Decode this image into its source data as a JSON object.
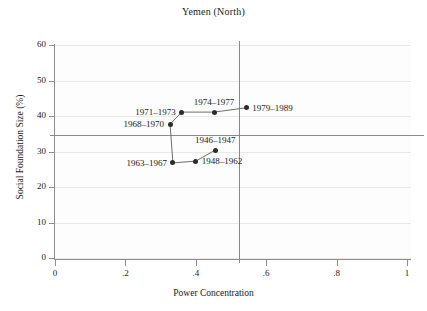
{
  "chart_data": {
    "type": "scatter",
    "title": "Yemen (North)",
    "xlabel": "Power Concentration",
    "ylabel": "Social Foundation Size (%)",
    "xlim": [
      0,
      1
    ],
    "ylim": [
      0,
      63
    ],
    "grid": true,
    "legend": "none",
    "connected": true,
    "xticks": [
      "0",
      ".2",
      ".4",
      ".6",
      ".8",
      "1"
    ],
    "xtick_values": [
      0,
      0.2,
      0.4,
      0.6,
      0.8,
      1
    ],
    "yticks": [
      "0",
      "10",
      "20",
      "30",
      "40",
      "50",
      "60"
    ],
    "ytick_values": [
      0,
      10,
      20,
      30,
      40,
      50,
      60
    ],
    "reference_lines": [
      {
        "name": "vertical-mean-power-concentration",
        "orientation": "vertical",
        "value": 0.523
      },
      {
        "name": "horizontal-mean-social-foundation",
        "orientation": "horizontal",
        "value": 34.6
      }
    ],
    "points": [
      {
        "label": "1946–1947",
        "x": 0.455,
        "y": 30.4,
        "label_pos": "above"
      },
      {
        "label": "1948–1962",
        "x": 0.4,
        "y": 27.3,
        "label_pos": "right"
      },
      {
        "label": "1963–1967",
        "x": 0.335,
        "y": 26.8,
        "label_pos": "left"
      },
      {
        "label": "1968–1970",
        "x": 0.327,
        "y": 37.7,
        "label_pos": "left"
      },
      {
        "label": "1971–1973",
        "x": 0.36,
        "y": 41.1,
        "label_pos": "left"
      },
      {
        "label": "1974–1977",
        "x": 0.452,
        "y": 41.1,
        "label_pos": "above"
      },
      {
        "label": "1979–1989",
        "x": 0.543,
        "y": 42.3,
        "label_pos": "right"
      }
    ],
    "path_order": [
      "1946–1947",
      "1948–1962",
      "1963–1967",
      "1968–1970",
      "1971–1973",
      "1974–1977",
      "1979–1989"
    ],
    "colors": {
      "marker": "#2b2b2b",
      "line": "#6e6e6e",
      "axis": "#8d8d8d",
      "grid": "#e9e9e9",
      "reference": "#8a8a8a",
      "text": "#1a1a1a",
      "background": "#ffffff"
    }
  }
}
